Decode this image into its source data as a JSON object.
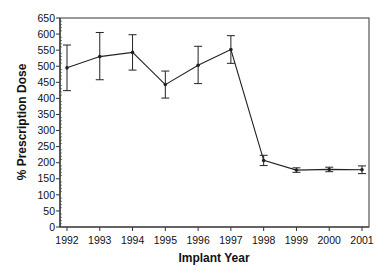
{
  "chart_data": {
    "type": "line",
    "title": "",
    "xlabel": "Implant Year",
    "ylabel": "% Prescription Dose",
    "ylim": [
      0,
      650
    ],
    "yticks": [
      0,
      50,
      100,
      150,
      200,
      250,
      300,
      350,
      400,
      450,
      500,
      550,
      600,
      650
    ],
    "y_minor_step": 10,
    "grid": false,
    "legend": null,
    "categories": [
      "1992",
      "1993",
      "1994",
      "1995",
      "1996",
      "1997",
      "1998",
      "1999",
      "2000",
      "2001"
    ],
    "series": [
      {
        "name": "Mean % Prescription Dose",
        "values": [
          495,
          530,
          543,
          443,
          503,
          552,
          207,
          177,
          179,
          178
        ],
        "error_upper": [
          566,
          605,
          598,
          485,
          562,
          595,
          223,
          184,
          186,
          190
        ],
        "error_lower": [
          424,
          458,
          488,
          401,
          446,
          509,
          191,
          170,
          172,
          166
        ],
        "color": "#222222"
      }
    ]
  },
  "colors": {
    "line": "#222222",
    "axis": "#333333",
    "frame": "#555555",
    "background": "#ffffff"
  }
}
